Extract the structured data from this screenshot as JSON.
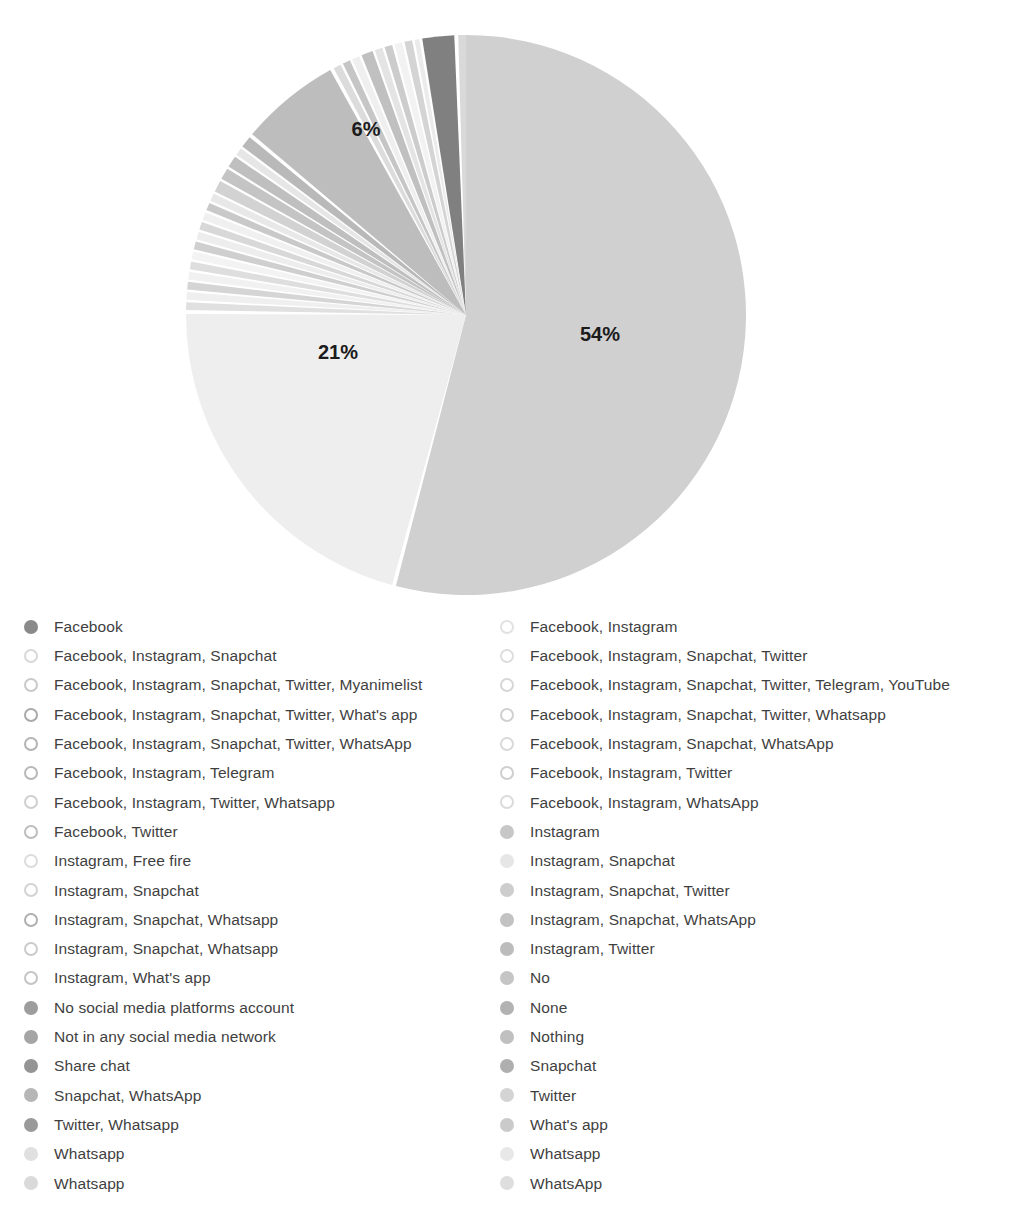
{
  "chart_data": {
    "type": "pie",
    "title": "",
    "subtitle": "",
    "xlabel": "",
    "ylabel": "",
    "legend_position": "bottom",
    "grid": false,
    "value_labels_shown": [
      "54%",
      "21%",
      "6%"
    ],
    "labels": [
      "Facebook",
      "Facebook, Instagram",
      "Facebook, Instagram, Snapchat",
      "Facebook, Instagram, Snapchat, Twitter",
      "Facebook, Instagram, Snapchat, Twitter, Myanimelist",
      "Facebook, Instagram, Snapchat, Twitter, Telegram, YouTube",
      "Facebook, Instagram, Snapchat, Twitter, What's app",
      "Facebook, Instagram, Snapchat, Twitter, Whatsapp",
      "Facebook, Instagram, Snapchat, Twitter, WhatsApp",
      "Facebook, Instagram, Snapchat, WhatsApp",
      "Facebook, Instagram, Telegram",
      "Facebook, Instagram, Twitter",
      "Facebook, Instagram, Twitter, Whatsapp",
      "Facebook, Instagram, WhatsApp",
      "Facebook, Twitter",
      "Instagram",
      "Instagram, Free fire",
      "Instagram, Snapchat",
      "Instagram, Snapchat",
      "Instagram, Snapchat, Twitter",
      "Instagram, Snapchat, Whatsapp",
      "Instagram, Snapchat, WhatsApp",
      "Instagram, Snapchat, Whatsapp",
      "Instagram, Twitter",
      "Instagram, What's app",
      "No",
      "No social media platforms account",
      "None",
      "Not in any social media network",
      "Nothing",
      "Share chat",
      "Snapchat",
      "Snapchat, WhatsApp",
      "Twitter",
      "Twitter, Whatsapp",
      "What's app",
      "Whatsapp",
      "Whatsapp",
      "Whatsapp",
      "WhatsApp",
      "WhatsApp",
      "Instagram, Snapchat, Whatsapp"
    ],
    "values": [
      1.4,
      0.5,
      0.5,
      0.5,
      0.5,
      0.5,
      0.5,
      0.5,
      0.5,
      0.5,
      0.5,
      0.5,
      0.5,
      0.5,
      0.5,
      0.9,
      0.5,
      0.5,
      0.5,
      0.5,
      0.5,
      0.5,
      0.5,
      0.5,
      0.5,
      0.9,
      0.9,
      0.9,
      0.9,
      0.9,
      0.9,
      0.9,
      0.9,
      0.9,
      0.9,
      0.9,
      54.0,
      21.0,
      6.0,
      0.9,
      0.9,
      0.5
    ],
    "major_slices": [
      {
        "label": "54%",
        "value": 54
      },
      {
        "label": "21%",
        "value": 21
      },
      {
        "label": "6%",
        "value": 6
      }
    ]
  },
  "pie": {
    "center_x": 466,
    "center_y": 315,
    "radius": 280,
    "labels": [
      {
        "text": "54%",
        "x": 600,
        "y": 336
      },
      {
        "text": "21%",
        "x": 338,
        "y": 354
      },
      {
        "text": "6%",
        "x": 366,
        "y": 131
      }
    ],
    "slices": [
      {
        "name": "facebook",
        "start": 351.0,
        "end": 357.6,
        "color": "#808080"
      },
      {
        "name": "facebook-instagram",
        "start": 358.4,
        "end": 360.0,
        "color": "#d9d9d9"
      },
      {
        "name": "major-54",
        "start": 0.0,
        "end": 194.5,
        "color": "#d0d0d0"
      },
      {
        "name": "major-21",
        "start": 195.3,
        "end": 270.2,
        "color": "#eeeeee"
      },
      {
        "name": "thin-01",
        "start": 271.0,
        "end": 272.6,
        "color": "#e0e0e0"
      },
      {
        "name": "thin-02",
        "start": 273.1,
        "end": 274.7,
        "color": "#efefef"
      },
      {
        "name": "thin-03",
        "start": 275.2,
        "end": 276.8,
        "color": "#d5d5d5"
      },
      {
        "name": "thin-04",
        "start": 277.3,
        "end": 278.9,
        "color": "#f1f1f1"
      },
      {
        "name": "thin-05",
        "start": 279.4,
        "end": 281.0,
        "color": "#dedede"
      },
      {
        "name": "thin-06",
        "start": 281.5,
        "end": 283.1,
        "color": "#f3f3f3"
      },
      {
        "name": "thin-07",
        "start": 283.6,
        "end": 285.2,
        "color": "#cfcfcf"
      },
      {
        "name": "thin-08",
        "start": 285.7,
        "end": 287.3,
        "color": "#ededed"
      },
      {
        "name": "thin-09",
        "start": 287.8,
        "end": 289.4,
        "color": "#d8d8d8"
      },
      {
        "name": "thin-10",
        "start": 289.9,
        "end": 291.5,
        "color": "#f0f0f0"
      },
      {
        "name": "thin-11",
        "start": 292.0,
        "end": 293.6,
        "color": "#c9c9c9"
      },
      {
        "name": "thin-12",
        "start": 294.1,
        "end": 295.7,
        "color": "#e8e8e8"
      },
      {
        "name": "thin-13",
        "start": 296.2,
        "end": 298.6,
        "color": "#d2d2d2"
      },
      {
        "name": "thin-14",
        "start": 299.1,
        "end": 301.5,
        "color": "#c4c4c4"
      },
      {
        "name": "thin-15",
        "start": 302.0,
        "end": 304.4,
        "color": "#bfbfbf"
      },
      {
        "name": "thin-16",
        "start": 304.9,
        "end": 306.5,
        "color": "#e6e6e6"
      },
      {
        "name": "thin-17",
        "start": 307.0,
        "end": 309.4,
        "color": "#b9b9b9"
      },
      {
        "name": "major-6",
        "start": 310.2,
        "end": 331.0,
        "color": "#bdbdbd"
      },
      {
        "name": "thin-18",
        "start": 331.8,
        "end": 333.4,
        "color": "#dcdcdc"
      },
      {
        "name": "thin-19",
        "start": 333.9,
        "end": 335.5,
        "color": "#c6c6c6"
      },
      {
        "name": "thin-20",
        "start": 336.0,
        "end": 337.6,
        "color": "#efefef"
      },
      {
        "name": "thin-21",
        "start": 338.1,
        "end": 340.5,
        "color": "#c0c0c0"
      },
      {
        "name": "thin-22",
        "start": 341.0,
        "end": 342.6,
        "color": "#e4e4e4"
      },
      {
        "name": "thin-23",
        "start": 343.1,
        "end": 344.7,
        "color": "#cccccc"
      },
      {
        "name": "thin-24",
        "start": 345.2,
        "end": 346.8,
        "color": "#f2f2f2"
      },
      {
        "name": "thin-25",
        "start": 347.3,
        "end": 348.9,
        "color": "#d4d4d4"
      },
      {
        "name": "thin-26",
        "start": 349.4,
        "end": 350.4,
        "color": "#ebebeb"
      }
    ]
  },
  "legend": {
    "left_column": [
      {
        "label": "Facebook",
        "color": "#8a8a8a",
        "style": "filled"
      },
      {
        "label": "Facebook, Instagram, Snapchat",
        "color": "#d8d8d8",
        "style": "ring"
      },
      {
        "label": "Facebook, Instagram, Snapchat, Twitter, Myanimelist",
        "color": "#c9c9c9",
        "style": "ring"
      },
      {
        "label": "Facebook, Instagram, Snapchat, Twitter, What's app",
        "color": "#a9a9a9",
        "style": "ring"
      },
      {
        "label": "Facebook, Instagram, Snapchat, Twitter, WhatsApp",
        "color": "#b4b4b4",
        "style": "ring"
      },
      {
        "label": "Facebook, Instagram, Telegram",
        "color": "#b8b8b8",
        "style": "ring"
      },
      {
        "label": "Facebook, Instagram, Twitter, Whatsapp",
        "color": "#cfcfcf",
        "style": "ring"
      },
      {
        "label": "Facebook, Twitter",
        "color": "#bdbdbd",
        "style": "ring"
      },
      {
        "label": "Instagram, Free fire",
        "color": "#dcdcdc",
        "style": "ring"
      },
      {
        "label": "Instagram, Snapchat",
        "color": "#d3d3d3",
        "style": "ring"
      },
      {
        "label": "Instagram, Snapchat, Whatsapp",
        "color": "#b0b0b0",
        "style": "ring"
      },
      {
        "label": "Instagram, Snapchat, Whatsapp",
        "color": "#cbcbcb",
        "style": "ring"
      },
      {
        "label": "Instagram, What's app",
        "color": "#c4c4c4",
        "style": "ring"
      },
      {
        "label": "No social media platforms account",
        "color": "#9d9d9d",
        "style": "filled"
      },
      {
        "label": "Not in any social media network",
        "color": "#a5a5a5",
        "style": "filled"
      },
      {
        "label": "Share chat",
        "color": "#949494",
        "style": "filled"
      },
      {
        "label": "Snapchat, WhatsApp",
        "color": "#b6b6b6",
        "style": "filled"
      },
      {
        "label": "Twitter, Whatsapp",
        "color": "#9a9a9a",
        "style": "filled"
      },
      {
        "label": "Whatsapp",
        "color": "#e0e0e0",
        "style": "filled"
      },
      {
        "label": "Whatsapp",
        "color": "#dadada",
        "style": "filled"
      }
    ],
    "right_column": [
      {
        "label": "Facebook, Instagram",
        "color": "#e2e2e2",
        "style": "ring"
      },
      {
        "label": "Facebook, Instagram, Snapchat, Twitter",
        "color": "#dddddd",
        "style": "ring"
      },
      {
        "label": "Facebook, Instagram, Snapchat, Twitter, Telegram, YouTube",
        "color": "#d6d6d6",
        "style": "ring"
      },
      {
        "label": "Facebook, Instagram, Snapchat, Twitter, Whatsapp",
        "color": "#d0d0d0",
        "style": "ring"
      },
      {
        "label": "Facebook, Instagram, Snapchat, WhatsApp",
        "color": "#d9d9d9",
        "style": "ring"
      },
      {
        "label": "Facebook, Instagram, Twitter",
        "color": "#cecece",
        "style": "ring"
      },
      {
        "label": "Facebook, Instagram, WhatsApp",
        "color": "#dbdbdb",
        "style": "ring"
      },
      {
        "label": "Instagram",
        "color": "#c7c7c7",
        "style": "filled"
      },
      {
        "label": "Instagram, Snapchat",
        "color": "#e6e6e6",
        "style": "filled"
      },
      {
        "label": "Instagram, Snapchat, Twitter",
        "color": "#cdcdcd",
        "style": "filled"
      },
      {
        "label": "Instagram, Snapchat, WhatsApp",
        "color": "#c2c2c2",
        "style": "filled"
      },
      {
        "label": "Instagram, Twitter",
        "color": "#bcbcbc",
        "style": "filled"
      },
      {
        "label": "No",
        "color": "#c5c5c5",
        "style": "filled"
      },
      {
        "label": "None",
        "color": "#b2b2b2",
        "style": "filled"
      },
      {
        "label": "Nothing",
        "color": "#c0c0c0",
        "style": "filled"
      },
      {
        "label": "Snapchat",
        "color": "#afafaf",
        "style": "filled"
      },
      {
        "label": "Twitter",
        "color": "#d4d4d4",
        "style": "filled"
      },
      {
        "label": "What's app",
        "color": "#cacaca",
        "style": "filled"
      },
      {
        "label": "Whatsapp",
        "color": "#e8e8e8",
        "style": "filled"
      },
      {
        "label": "WhatsApp",
        "color": "#dedede",
        "style": "filled"
      }
    ]
  }
}
